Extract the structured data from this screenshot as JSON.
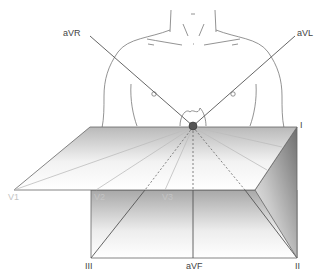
{
  "diagram": {
    "frontal_leads": {
      "aVR": "aVR",
      "aVL": "aVL",
      "I": "I",
      "II": "II",
      "III": "III",
      "aVF": "aVF"
    },
    "precordial_leads": {
      "V1": "V1",
      "V2": "V2",
      "V3": "V3"
    },
    "colors": {
      "line": "#555555",
      "outline": "#666666",
      "faint_label": "#c4c4c4",
      "node": "#444444"
    }
  }
}
